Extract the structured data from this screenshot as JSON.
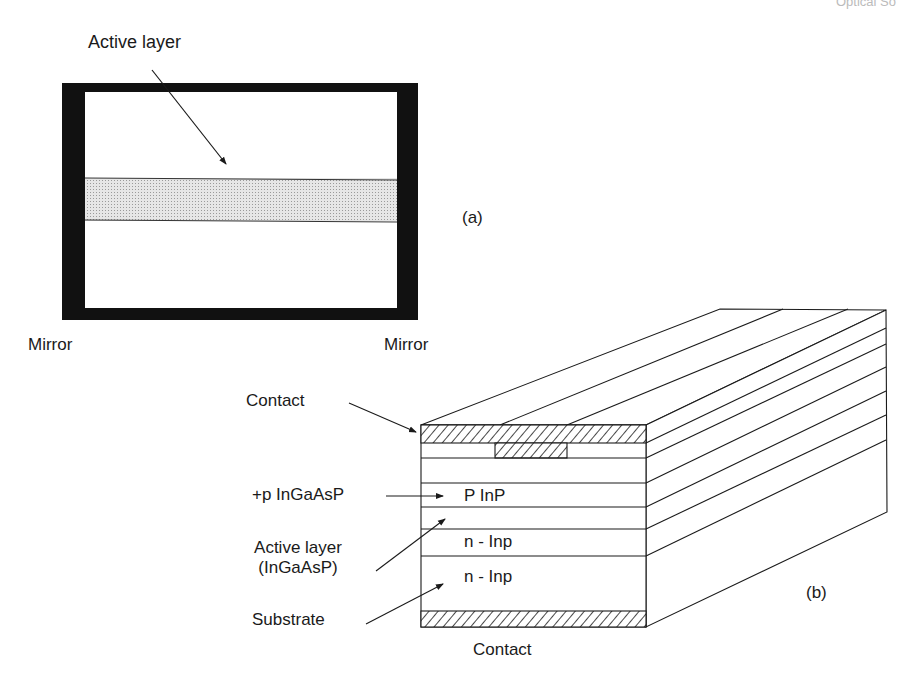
{
  "page": {
    "header_fragment": "Optical So",
    "background": "#ffffff",
    "line_color": "#1a1a1a"
  },
  "figure_a": {
    "panel_label": "(a)",
    "active_layer_label": "Active layer",
    "mirror_left_label": "Mirror",
    "mirror_right_label": "Mirror",
    "mirror_color": "#111111",
    "active_band_color": "#d9d9d9"
  },
  "figure_b": {
    "panel_label": "(b)",
    "labels": {
      "contact_top": "Contact",
      "p_ingaasp": "+p InGaAsP",
      "active_layer_line1": "Active layer",
      "active_layer_line2": "(InGaAsP)",
      "substrate": "Substrate",
      "contact_bottom": "Contact"
    },
    "layer_labels": {
      "p_inp": "P InP",
      "n_inp_1": "n - Inp",
      "n_inp_2": "n - Inp"
    },
    "layers_top_to_bottom": [
      "Contact (hatched)",
      "Cap layer with contact stripe (hatched)",
      "+p InGaAsP",
      "P InP",
      "Active layer (InGaAsP)",
      "n - Inp",
      "n - Inp (substrate)",
      "Contact (hatched)"
    ]
  }
}
